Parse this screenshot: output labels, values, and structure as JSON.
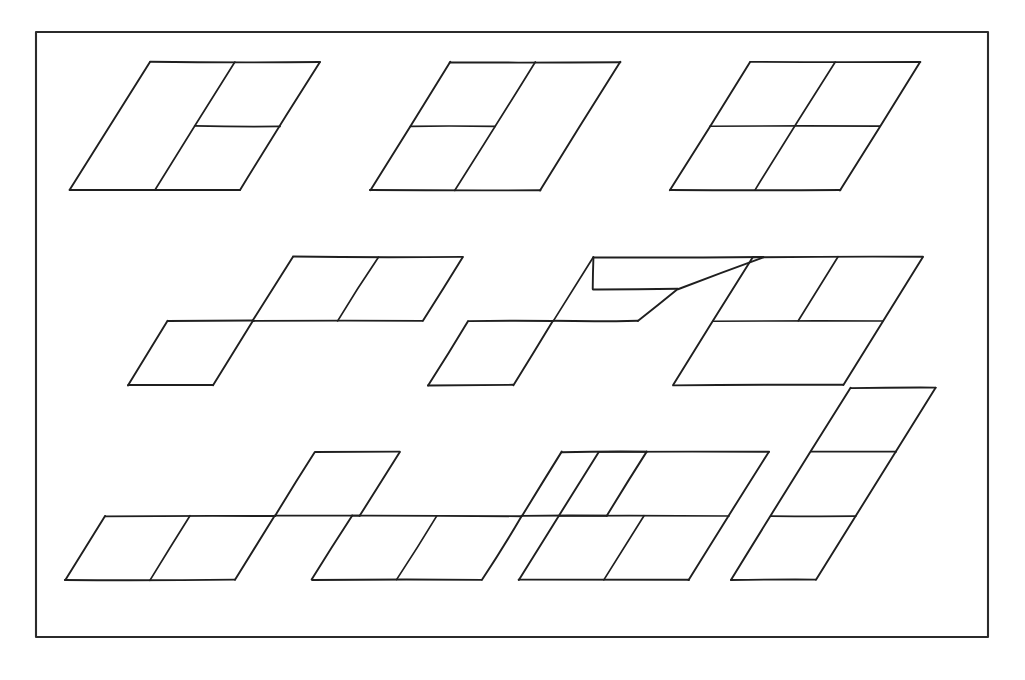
{
  "page": {
    "background_color": "#ffffff",
    "ink_color": "#1f1f1f",
    "width": 1025,
    "height": 680
  },
  "frame": {
    "name": "outer-border",
    "x": 36,
    "y": 32,
    "width": 952,
    "height": 605,
    "stroke_color": "#2b2b2b",
    "stroke_width": 2.1
  },
  "lattice": {
    "description": "Sheared unit cell: horizontal top/bottom edges, slanted side edges leaning right as they rise.",
    "cell_width": 85,
    "cell_height": 64,
    "shear_per_cell": 40
  },
  "figures": [
    {
      "id": "figure-1",
      "label": "row1-col1",
      "row": 1,
      "col": 1,
      "origin_x": 70,
      "origin_y": 190,
      "cell_width": 85,
      "cell_height": 64,
      "shear": 40,
      "cells": [
        [
          0,
          0
        ],
        [
          1,
          0
        ],
        [
          0,
          1
        ],
        [
          1,
          1
        ]
      ],
      "dividers": [
        "horizontal-right-column",
        "vertical-center-full"
      ],
      "shape_note": "2x2 block with the horizontal split only across the right column"
    },
    {
      "id": "figure-2",
      "label": "row1-col2",
      "row": 1,
      "col": 2,
      "origin_x": 370,
      "origin_y": 190,
      "cell_width": 85,
      "cell_height": 64,
      "shear": 40,
      "cells": [
        [
          0,
          0
        ],
        [
          1,
          0
        ],
        [
          0,
          1
        ],
        [
          1,
          1
        ]
      ],
      "dividers": [
        "horizontal-left-column",
        "vertical-center-full"
      ],
      "shape_note": "2x2 block with the horizontal split only across the left column"
    },
    {
      "id": "figure-3",
      "label": "row1-col3",
      "row": 1,
      "col": 3,
      "origin_x": 670,
      "origin_y": 190,
      "cell_width": 85,
      "cell_height": 64,
      "shear": 40,
      "cells": [
        [
          0,
          0
        ],
        [
          1,
          0
        ],
        [
          0,
          1
        ],
        [
          1,
          1
        ]
      ],
      "dividers": [
        "horizontal-full",
        "vertical-center-full"
      ],
      "shape_note": "Full 2x2 grid, both dividers span the whole block"
    },
    {
      "id": "figure-4",
      "label": "row2-col1",
      "row": 2,
      "col": 1,
      "origin_x": 128,
      "origin_y": 385,
      "cell_width": 85,
      "cell_height": 64,
      "shear": 40,
      "cells": [
        [
          0,
          0
        ],
        [
          1,
          1
        ],
        [
          2,
          1
        ]
      ],
      "shape_note": "S / Z staircase: one cell on the lower row, two cells on the upper row shifted right"
    },
    {
      "id": "figure-5",
      "label": "row2-col2",
      "row": 2,
      "col": 2,
      "origin_x": 428,
      "origin_y": 385,
      "cell_width": 85,
      "cell_height": 64,
      "shear": 40,
      "cells": [
        [
          0,
          0
        ],
        [
          1,
          1
        ],
        [
          2,
          1
        ]
      ],
      "shape_note": "Staircase with a half-height cell at the upper right"
    },
    {
      "id": "figure-6",
      "label": "row2-col3",
      "row": 2,
      "col": 3,
      "origin_x": 673,
      "origin_y": 385,
      "cell_width": 85,
      "cell_height": 64,
      "shear": 40,
      "cells": [
        [
          0,
          0
        ],
        [
          1,
          0
        ],
        [
          0,
          1
        ],
        [
          1,
          1
        ]
      ],
      "dividers": [
        "horizontal-full",
        "vertical-upper-only"
      ],
      "shape_note": "Lower half is one wide cell, upper half split into two cells"
    },
    {
      "id": "figure-7",
      "label": "row3-col1",
      "row": 3,
      "col": 1,
      "origin_x": 65,
      "origin_y": 580,
      "cell_width": 85,
      "cell_height": 64,
      "shear": 40,
      "cells": [
        [
          0,
          0
        ],
        [
          1,
          0
        ],
        [
          1,
          1
        ]
      ],
      "shape_note": "Two cells on the lower row, one cell above the right-hand cell"
    },
    {
      "id": "figure-8",
      "label": "row3-col2",
      "row": 3,
      "col": 2,
      "origin_x": 312,
      "origin_y": 580,
      "cell_width": 85,
      "cell_height": 64,
      "shear": 40,
      "cells": [
        [
          0,
          0
        ],
        [
          1,
          0
        ],
        [
          1,
          1
        ]
      ],
      "shape_note": "Two cells on the lower row, one cell above the right-hand cell"
    },
    {
      "id": "figure-9",
      "label": "row3-col3",
      "row": 3,
      "col": 3,
      "origin_x": 519,
      "origin_y": 580,
      "cell_width": 85,
      "cell_height": 64,
      "shear": 40,
      "cells": [
        [
          0,
          0
        ],
        [
          1,
          0
        ],
        [
          0,
          1
        ],
        [
          1,
          1
        ]
      ],
      "dividers": [
        "horizontal-full",
        "vertical-lower-only"
      ],
      "shape_note": "Upper half is one wide cell, lower half split into two cells"
    },
    {
      "id": "figure-10",
      "label": "row3-col4",
      "row": 3,
      "col": 4,
      "origin_x": 731,
      "origin_y": 580,
      "cell_width": 85,
      "cell_height": 64,
      "shear": 40,
      "cells": [
        [
          0,
          0
        ],
        [
          0,
          1
        ],
        [
          0,
          2
        ]
      ],
      "dividers": [
        "horizontal-at-1",
        "horizontal-at-2"
      ],
      "shape_note": "Single tall column of three stacked cells"
    }
  ],
  "summary": {
    "figure_count": 10,
    "rows": 3,
    "row_counts": [
      3,
      3,
      4
    ]
  }
}
